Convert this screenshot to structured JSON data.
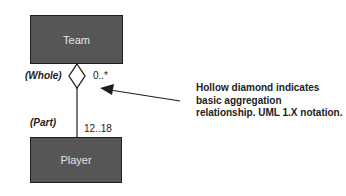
{
  "diagram": {
    "classes": [
      {
        "id": "team",
        "label": "Team"
      },
      {
        "id": "player",
        "label": "Player"
      }
    ],
    "association": {
      "type": "aggregation",
      "whole_role": "(Whole)",
      "part_role": "(Part)",
      "whole_multiplicity": "0..*",
      "part_multiplicity": "12..18"
    },
    "annotation": {
      "lines": [
        "Hollow diamond indicates",
        "basic aggregation",
        "relationship. UML 1.X notation."
      ]
    }
  }
}
